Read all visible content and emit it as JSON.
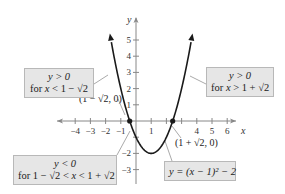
{
  "chart_data": {
    "type": "line",
    "title": "",
    "function": "y = (x - 1)^2 - 2",
    "xlabel": "x",
    "ylabel": "y",
    "xlim": [
      -4.5,
      6.5
    ],
    "ylim": [
      -3.5,
      5.8
    ],
    "grid": false,
    "x_ticks": [
      -4,
      -3,
      -2,
      -1,
      1,
      4,
      5,
      6
    ],
    "x_tick_marks": [
      -4,
      -3,
      -2,
      -1,
      1,
      2,
      3,
      4,
      5,
      6
    ],
    "y_ticks": [
      5,
      4,
      3,
      2,
      1,
      -2,
      -3
    ],
    "y_tick_marks": [
      5,
      4,
      3,
      2,
      1,
      -1,
      -2,
      -3
    ],
    "vertex": [
      1,
      -2
    ],
    "x_intercepts": [
      {
        "x": -0.4142,
        "y": 0,
        "label": "(1 − √2, 0)"
      },
      {
        "x": 2.4142,
        "y": 0,
        "label": "(1 + √2, 0)"
      }
    ],
    "series": [
      {
        "name": "y = (x − 1)² − 2",
        "x": [
          -1.6,
          -1,
          -0.4142,
          0,
          1,
          2,
          2.4142,
          3,
          3.6
        ],
        "y": [
          4.76,
          2,
          0,
          -1,
          -2,
          -1,
          0,
          2,
          4.76
        ]
      }
    ],
    "annotations": [
      {
        "text": "y > 0 for x < 1 − √2"
      },
      {
        "text": "y > 0 for x > 1 + √2"
      },
      {
        "text": "y < 0 for 1 − √2 < x < 1 + √2"
      },
      {
        "text": "y = (x − 1)² − 2"
      }
    ]
  },
  "labels": {
    "x_axis": "x",
    "y_axis": "y",
    "x_ticks": [
      "−4",
      "−3",
      "−2",
      "−1",
      "1",
      "4",
      "5",
      "6"
    ],
    "y_ticks": [
      "5",
      "4",
      "3",
      "2",
      "1",
      "−2",
      "−3"
    ],
    "left_intercept": "(1 − √2, 0)",
    "right_intercept": "(1 + √2, 0)"
  },
  "callouts": {
    "left_positive": {
      "line1": "y > 0",
      "line2_prefix": "for ",
      "line2_var": "x",
      "line2_rest": " < 1 − √2"
    },
    "right_positive": {
      "line1": "y > 0",
      "line2_prefix": "for ",
      "line2_var": "x",
      "line2_rest": " > 1 + √2"
    },
    "negative": {
      "line1": "y < 0",
      "line2_prefix": "for 1 − √2 < ",
      "line2_var": "x",
      "line2_rest": " < 1 + √2"
    },
    "equation": {
      "text": "y = (x − 1)² − 2"
    }
  },
  "colors": {
    "curve": "#1a1a1a",
    "axis": "#888888",
    "callout_bg": "#e6e6e6",
    "callout_border": "#b8b8b8",
    "leader": "#aaaaaa"
  }
}
